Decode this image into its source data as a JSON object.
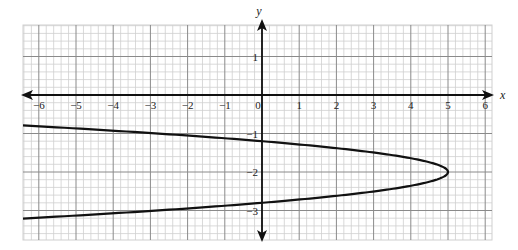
{
  "chart_data": {
    "type": "line",
    "title": "",
    "xlabel": "x",
    "ylabel": "y",
    "xlim": [
      -6.4,
      6.2
    ],
    "ylim": [
      -3.8,
      1.8
    ],
    "grid": true,
    "grid_minor_subdivisions": 5,
    "x_ticks": [
      -6,
      -5,
      -4,
      -3,
      -2,
      -1,
      0,
      1,
      2,
      3,
      4,
      5,
      6
    ],
    "x_tick_labels": [
      "−6",
      "−5",
      "−4",
      "−3",
      "−2",
      "−1",
      "0",
      "1",
      "2",
      "3",
      "4",
      "5",
      "6"
    ],
    "y_ticks": [
      1,
      -1,
      -2,
      -3
    ],
    "y_tick_labels": [
      "1",
      "−1",
      "−2",
      "−3"
    ],
    "series": [
      {
        "name": "parabola",
        "equation": "x = 5 - 7.8(y + 2)^2",
        "vertex": [
          5,
          -2
        ],
        "y_intercepts": [
          -1.2,
          -2.8
        ],
        "points": [
          {
            "x": -6.4,
            "y": -0.79
          },
          {
            "x": -5,
            "y": -0.87
          },
          {
            "x": -4,
            "y": -0.93
          },
          {
            "x": -3,
            "y": -0.99
          },
          {
            "x": -2,
            "y": -1.05
          },
          {
            "x": -1,
            "y": -1.12
          },
          {
            "x": 0,
            "y": -1.2
          },
          {
            "x": 1,
            "y": -1.28
          },
          {
            "x": 2,
            "y": -1.38
          },
          {
            "x": 3,
            "y": -1.49
          },
          {
            "x": 4,
            "y": -1.64
          },
          {
            "x": 5,
            "y": -2.0
          },
          {
            "x": 4,
            "y": -2.36
          },
          {
            "x": 3,
            "y": -2.51
          },
          {
            "x": 2,
            "y": -2.62
          },
          {
            "x": 1,
            "y": -2.72
          },
          {
            "x": 0,
            "y": -2.8
          },
          {
            "x": -1,
            "y": -2.88
          },
          {
            "x": -2,
            "y": -2.95
          },
          {
            "x": -3,
            "y": -3.01
          },
          {
            "x": -4,
            "y": -3.07
          },
          {
            "x": -5,
            "y": -3.13
          },
          {
            "x": -6.4,
            "y": -3.21
          }
        ]
      }
    ],
    "colors": {
      "curve": "#111111",
      "axis": "#111111",
      "grid_major": "#8a8a8a",
      "grid_minor": "#cfcfcf"
    }
  }
}
